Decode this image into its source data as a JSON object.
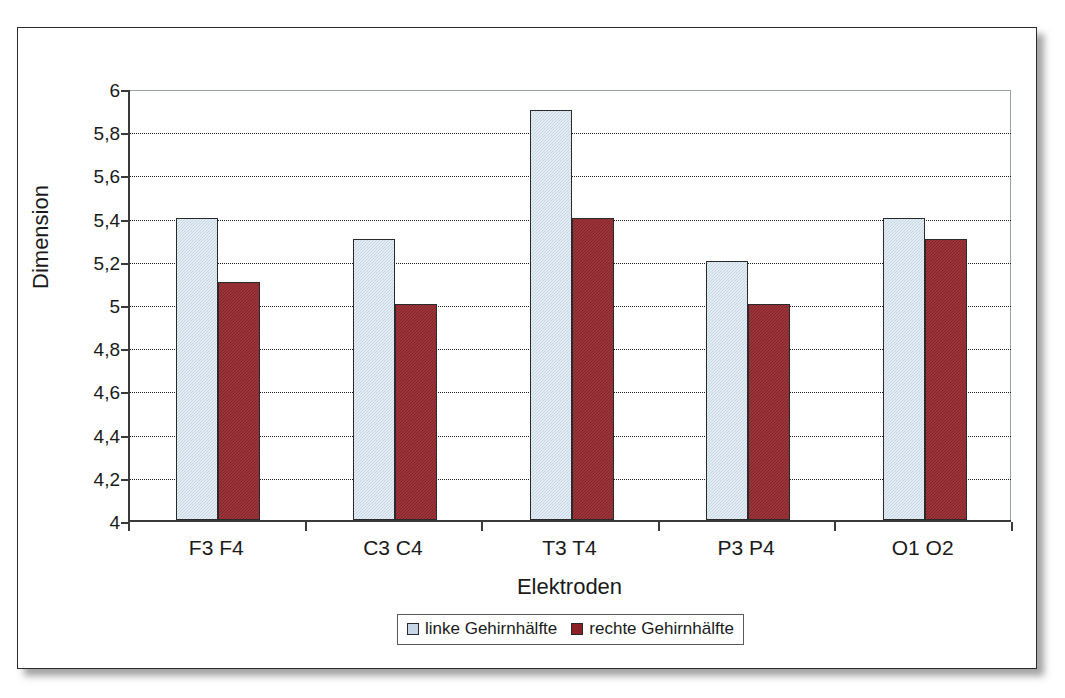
{
  "chart_data": {
    "type": "bar",
    "title": "",
    "xlabel": "Elektroden",
    "ylabel": "Dimension",
    "categories": [
      "F3  F4",
      "C3 C4",
      "T3 T4",
      "P3 P4",
      "O1 O2"
    ],
    "series": [
      {
        "name": "linke Gehirnhälfte",
        "color": "#c6d6e6",
        "values": [
          5.4,
          5.3,
          5.9,
          5.2,
          5.4
        ]
      },
      {
        "name": "rechte Gehirnhälfte",
        "color": "#8b2026",
        "values": [
          5.1,
          5.0,
          5.4,
          5.0,
          5.3
        ]
      }
    ],
    "ylim": [
      4,
      6
    ],
    "ytick_values": [
      4,
      4.2,
      4.4,
      4.6,
      4.8,
      5,
      5.2,
      5.4,
      5.6,
      5.8,
      6
    ],
    "ytick_labels": [
      "4",
      "4,2",
      "4,4",
      "4,6",
      "4,8",
      "5",
      "5,2",
      "5,4",
      "5,6",
      "5,8",
      "6"
    ],
    "grid": true,
    "legend_position": "bottom"
  },
  "colors": {
    "left_hemisphere": "#c6d6e6",
    "right_hemisphere": "#8b2026",
    "axis": "#3a3a3a",
    "gridline": "#1a1a1a",
    "frame": "#2b2b2b"
  }
}
